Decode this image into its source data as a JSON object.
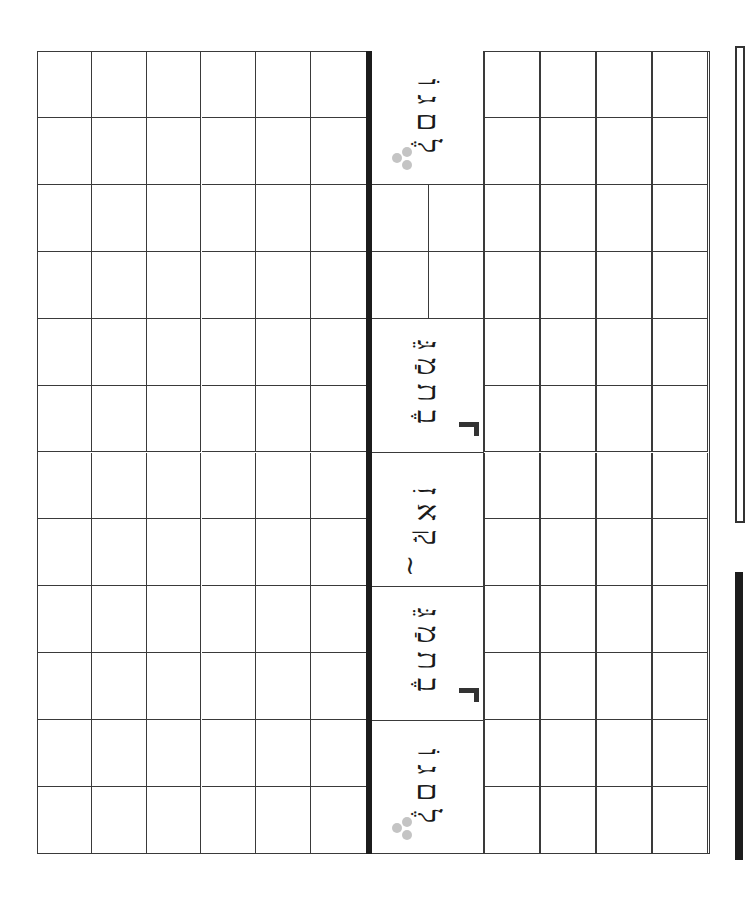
{
  "worksheet": {
    "grid": {
      "rows": 12,
      "left_columns": 6,
      "right_columns": 4,
      "line_color": "#3a3a3a",
      "divider_color": "#1c1c1c"
    },
    "words": [
      {
        "id": "word-1",
        "text": "גוֹלֶם",
        "parts": [
          "גוֹ",
          "לֶם"
        ],
        "marker": "dots"
      },
      {
        "id": "word-2",
        "text": "מַגֵּבֶת",
        "parts": [
          "מַגֵּ",
          "בֶת"
        ],
        "marker": "corner"
      },
      {
        "id": "word-3",
        "text": "קָאזִינוֹ",
        "parts": [
          "זִ",
          "קָא"
        ],
        "marker": "tilde"
      },
      {
        "id": "word-4",
        "text": "מַגֵּבֶת",
        "parts": [
          "מַגֵּ",
          "בֶת"
        ],
        "marker": "corner"
      },
      {
        "id": "word-5",
        "text": "גוֹלֶם",
        "parts": [
          "גוֹ",
          "לֶם"
        ],
        "marker": "dots"
      }
    ],
    "markers": {
      "tilde": "~"
    }
  }
}
